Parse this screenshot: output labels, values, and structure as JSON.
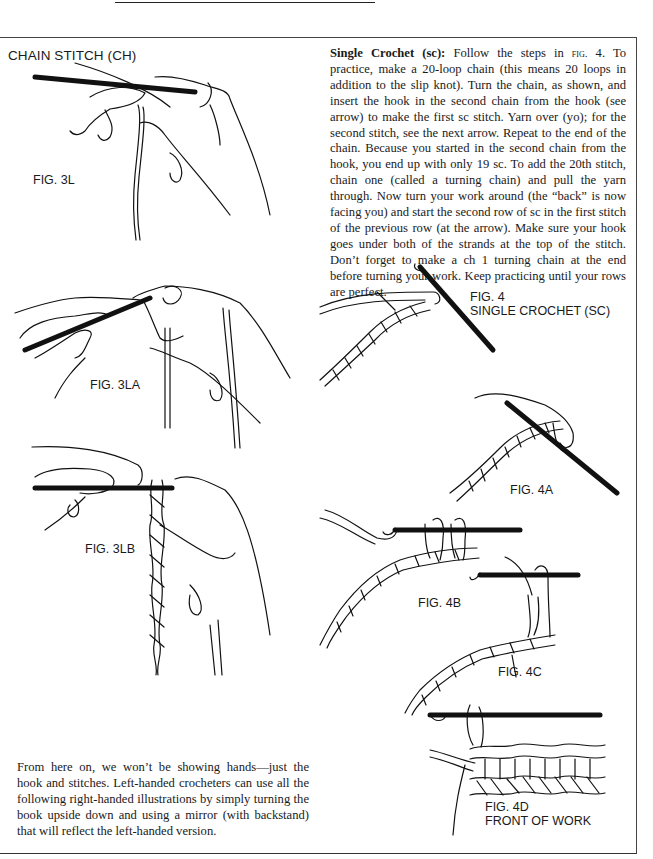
{
  "page": {
    "heading": "CHAIN STITCH (CH)",
    "single_crochet": {
      "title": "Single Crochet (sc):",
      "text_pre_fig": " Follow the steps in ",
      "fig_ref": "fig.",
      "text_post_fig": " 4. To practice, make a 20-loop chain (this means 20 loops in addition to the slip knot). Turn the chain, as shown, and insert the hook in the second chain from the hook (see arrow) to make the first sc stitch. Yarn over (yo); for the second stitch, see the next arrow. Repeat to the end of the chain. Because you started in the second chain from the hook, you end up with only 19 sc. To add the 20th stitch, chain one (called a turning chain) and pull the yarn through. Now turn your work around (the “back” is now facing you) and start the second row of sc in the first stitch of the previous row (at the arrow). Make sure your hook goes under both of the strands at the top of the stitch. Don’t forget to make a ch 1 turning chain at the end before turning your work. Keep practicing until your rows are perfect."
    },
    "footer_note": "From here on, we won’t be showing hands—just the hook and stitches. Left-handed crocheters can use all the following right-handed illustrations by simply turning the book upside down and using a mirror (with backstand) that will reflect the left-handed version.",
    "figures": {
      "fig3l": "FIG. 3L",
      "fig3la": "FIG. 3LA",
      "fig3lb": "FIG. 3LB",
      "fig4": "FIG. 4\nSINGLE CROCHET (SC)",
      "fig4a": "FIG. 4A",
      "fig4b": "FIG. 4B",
      "fig4c": "FIG. 4C",
      "fig4d": "FIG. 4D\nFRONT OF WORK"
    }
  }
}
